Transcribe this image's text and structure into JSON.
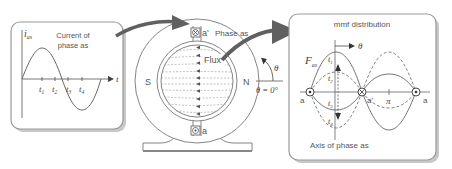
{
  "left_panel": {
    "title_line1": "Current of",
    "title_line2": "phase as",
    "y_axis_label": "i",
    "y_axis_sub": "as",
    "x_axis_label": "t",
    "ticks": [
      {
        "label": "t",
        "sub": "1"
      },
      {
        "label": "t",
        "sub": "2"
      },
      {
        "label": "t",
        "sub": "3"
      },
      {
        "label": "t",
        "sub": "4"
      }
    ]
  },
  "machine": {
    "flux_label": "Flux",
    "pole_left": "S",
    "pole_right": "N",
    "phase_label": "Phase as",
    "conductor_top": "a'",
    "conductor_bottom": "a",
    "angle_label": "θ",
    "angle_ref": "θ = 0°"
  },
  "right_panel": {
    "title": "mmf distribution",
    "y_axis_label": "F",
    "y_axis_sub": "as",
    "theta_label": "θ",
    "curve_labels": [
      {
        "label": "t",
        "sub": "1"
      },
      {
        "label": "t",
        "sub": "2"
      },
      {
        "label": "t",
        "sub": "3"
      },
      {
        "label": "t",
        "sub": "4"
      }
    ],
    "conductor_left": "a",
    "conductor_mid": "a'",
    "conductor_right": "a",
    "pi_label": "π",
    "axis_caption": "Axis of phase as"
  },
  "colors": {
    "line": "#666666",
    "frame": "#888888",
    "arrow": "#606060",
    "panel_border": "#9a9a9a",
    "panel_shadow": "#c8c8c8"
  }
}
